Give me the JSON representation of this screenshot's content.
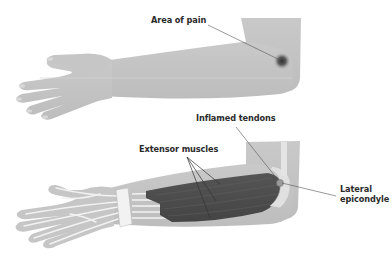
{
  "diagram": {
    "colors": {
      "background": "#ffffff",
      "skin": "#c4c4c4",
      "skin_shadow": "#b0b0b0",
      "muscle": "#4d4d4d",
      "tendon": "#f2f2f2",
      "pain_spot": "#3a3a3a",
      "leader_line": "#555555",
      "label_text": "#2b2b2b"
    },
    "top_view": {
      "name": "external-arm-view",
      "labels": {
        "area_of_pain": "Area of pain"
      }
    },
    "bottom_view": {
      "name": "internal-arm-view",
      "labels": {
        "inflamed_tendons": "Inflamed tendons",
        "extensor_muscles": "Extensor muscles",
        "lateral_epicondyle_line1": "Lateral",
        "lateral_epicondyle_line2": "epicondyle"
      }
    }
  }
}
